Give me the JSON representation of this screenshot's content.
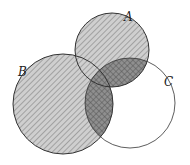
{
  "diagram": {
    "type": "venn",
    "sets": [
      {
        "name": "A",
        "cx": 112,
        "cy": 50,
        "r": 37,
        "shading": "hatched"
      },
      {
        "name": "B",
        "cx": 63,
        "cy": 104,
        "r": 50,
        "shading": "hatched"
      },
      {
        "name": "C",
        "cx": 130,
        "cy": 103,
        "r": 45,
        "shading": "none"
      }
    ],
    "highlighted_region": "(A ∪ B) ∩ C",
    "labels": {
      "A": "A",
      "B": "B",
      "C": "C"
    },
    "colors": {
      "stroke": "#333333",
      "hatch": "#888888",
      "cross": "#555555",
      "fill_light": "#c8c8c8",
      "fill_dark": "#8a8a8a"
    }
  }
}
